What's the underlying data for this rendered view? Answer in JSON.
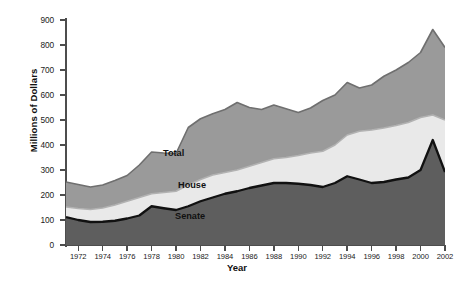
{
  "axes": {
    "ylabel": "Millions of Dollars",
    "xlabel": "Year",
    "yticks": [
      "0",
      "100",
      "200",
      "300",
      "400",
      "500",
      "600",
      "700",
      "800",
      "900"
    ],
    "xticks": [
      "1972",
      "1974",
      "1976",
      "1978",
      "1980",
      "1982",
      "1984",
      "1986",
      "1988",
      "1990",
      "1992",
      "1994",
      "1996",
      "1998",
      "2000",
      "2002"
    ]
  },
  "series_labels": {
    "total": "Total",
    "house": "House",
    "senate": "Senate"
  },
  "colors": {
    "senate_fill": "#5e5e5e",
    "house_fill": "#e9e9e9",
    "total_fill": "#9a9a9a",
    "senate_line": "#111111",
    "house_line": "#b2b2b2",
    "total_line": "#6f6f6f",
    "axis": "#4d4d4d",
    "background": "#ffffff"
  },
  "chart_data": {
    "type": "area",
    "stacked": true,
    "title": "",
    "xlabel": "Year",
    "ylabel": "Millions of Dollars",
    "xlim": [
      1971,
      2002
    ],
    "ylim": [
      0,
      900
    ],
    "grid": false,
    "legend_position": "inline-labels",
    "x": [
      1971,
      1972,
      1973,
      1974,
      1975,
      1976,
      1977,
      1978,
      1979,
      1980,
      1981,
      1982,
      1983,
      1984,
      1985,
      1986,
      1987,
      1988,
      1989,
      1990,
      1991,
      1992,
      1993,
      1994,
      1995,
      1996,
      1997,
      1998,
      1999,
      2000,
      2001,
      2002
    ],
    "series": [
      {
        "name": "Senate",
        "note": "lower band, cumulative boundary 1 (Senate spending)",
        "values": [
          112,
          100,
          92,
          93,
          97,
          106,
          118,
          155,
          147,
          140,
          155,
          175,
          190,
          205,
          215,
          228,
          238,
          248,
          248,
          245,
          240,
          232,
          248,
          275,
          262,
          248,
          252,
          262,
          270,
          300,
          420,
          292
        ]
      },
      {
        "name": "House",
        "note": "middle band, cumulative boundary 2 (Senate + House)",
        "values": [
          152,
          146,
          142,
          148,
          160,
          175,
          190,
          205,
          210,
          215,
          240,
          262,
          280,
          290,
          300,
          315,
          330,
          345,
          350,
          358,
          368,
          375,
          400,
          440,
          455,
          460,
          468,
          478,
          490,
          510,
          520,
          500
        ]
      },
      {
        "name": "Total",
        "note": "upper band, cumulative boundary 3 (all spending)",
        "values": [
          252,
          242,
          232,
          240,
          258,
          278,
          320,
          372,
          368,
          366,
          470,
          505,
          525,
          542,
          570,
          550,
          542,
          560,
          545,
          530,
          548,
          578,
          600,
          650,
          628,
          640,
          675,
          700,
          730,
          770,
          862,
          790
        ]
      }
    ]
  }
}
